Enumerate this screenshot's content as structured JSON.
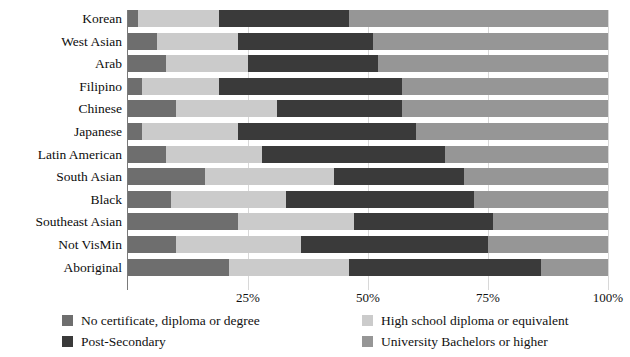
{
  "chart_data": {
    "type": "bar",
    "subtype": "horizontal-stacked-100",
    "title": "",
    "xlabel": "",
    "ylabel": "",
    "xlim": [
      0,
      100
    ],
    "grid": true,
    "legend_position": "bottom",
    "xticks": [
      "25%",
      "50%",
      "75%",
      "100%"
    ],
    "xtick_values": [
      25,
      50,
      75,
      100
    ],
    "categories": [
      "Korean",
      "West Asian",
      "Arab",
      "Filipino",
      "Chinese",
      "Japanese",
      "Latin American",
      "South Asian",
      "Black",
      "Southeast Asian",
      "Not VisMin",
      "Aboriginal"
    ],
    "series": [
      {
        "name": "No certificate, diploma or degree",
        "color": "#6e6e6e",
        "values": [
          2,
          6,
          8,
          3,
          10,
          3,
          8,
          16,
          9,
          23,
          10,
          21
        ]
      },
      {
        "name": "High school diploma or equivalent",
        "color": "#cbcbcb",
        "values": [
          17,
          17,
          17,
          16,
          21,
          20,
          20,
          27,
          24,
          24,
          26,
          25
        ]
      },
      {
        "name": "Post-Secondary",
        "color": "#3a3a3a",
        "values": [
          27,
          28,
          27,
          38,
          26,
          37,
          38,
          27,
          39,
          29,
          39,
          40
        ]
      },
      {
        "name": "University Bachelors or higher",
        "color": "#969696",
        "values": [
          54,
          49,
          48,
          43,
          43,
          40,
          34,
          30,
          28,
          24,
          25,
          14
        ]
      }
    ]
  },
  "legend": {
    "items": [
      {
        "label": "No certificate, diploma or degree",
        "color": "#6e6e6e"
      },
      {
        "label": "High school diploma or equivalent",
        "color": "#cbcbcb"
      },
      {
        "label": "Post-Secondary",
        "color": "#3a3a3a"
      },
      {
        "label": "University Bachelors or higher",
        "color": "#969696"
      }
    ]
  }
}
